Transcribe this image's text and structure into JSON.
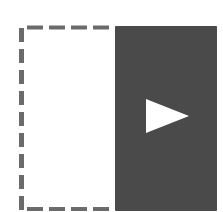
{
  "icon": {
    "name": "expand-panel-icon",
    "colors": {
      "background": "#ffffff",
      "dash": "#6b6b6b",
      "panel": "#4a4a4a",
      "arrow": "#ffffff"
    }
  }
}
